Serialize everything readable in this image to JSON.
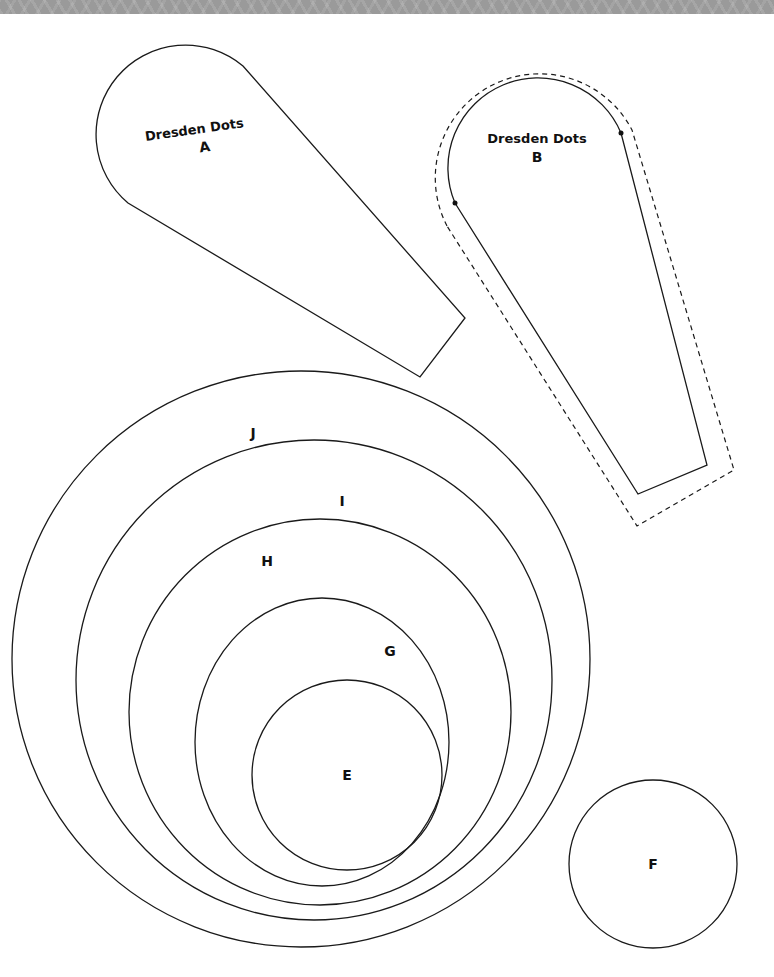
{
  "page": {
    "background": "#ffffff",
    "banner_color": "#9a9a9a",
    "stroke_color": "#1a1a1a"
  },
  "templates": {
    "a": {
      "title": "Dresden Dots",
      "letter": "A"
    },
    "b": {
      "title": "Dresden Dots",
      "letter": "B",
      "seam_allowance": "dashed outline"
    },
    "circles": [
      {
        "letter": "J"
      },
      {
        "letter": "I"
      },
      {
        "letter": "H"
      },
      {
        "letter": "G"
      },
      {
        "letter": "E"
      },
      {
        "letter": "F"
      }
    ]
  }
}
